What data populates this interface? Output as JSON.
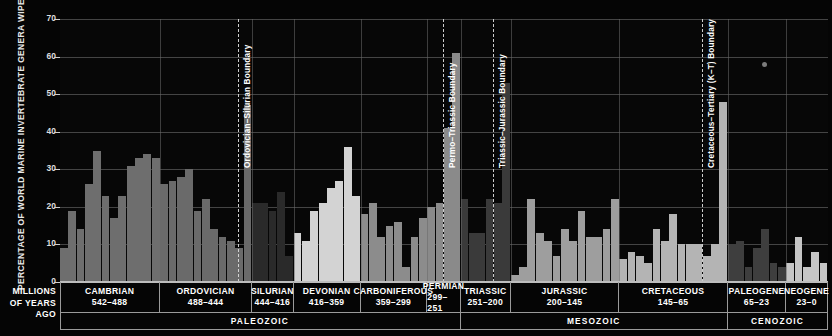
{
  "chart_data": {
    "type": "bar",
    "title": "",
    "ylabel": "PERCENTAGE OF WORLD MARINE INVERTEBRATE GENERA WIPED OUT",
    "xlabel": "MILLIONS OF YEARS AGO",
    "ylim": [
      0,
      70
    ],
    "yticks": [
      0,
      10,
      20,
      30,
      40,
      50,
      60,
      70
    ],
    "grid": true,
    "legend": "none",
    "series_name": "Extinction intensity (% marine invertebrate genera)",
    "periods": [
      {
        "name": "CAMBRIAN",
        "range": "542–488",
        "era": "PALEOZOIC",
        "color": "#6e6e6e",
        "values": [
          9,
          19,
          14,
          26,
          35,
          23,
          17,
          23,
          31,
          33,
          34,
          33
        ]
      },
      {
        "name": "ORDOVICIAN",
        "range": "488–444",
        "era": "PALEOZOIC",
        "color": "#6a6a6a",
        "values": [
          26,
          27,
          28,
          30,
          19,
          22,
          14,
          12,
          11,
          9,
          47
        ]
      },
      {
        "name": "SILURIAN",
        "range": "444–416",
        "era": "PALEOZOIC",
        "color": "#2a2a2a",
        "values": [
          21,
          21,
          19,
          24,
          7
        ]
      },
      {
        "name": "DEVONIAN",
        "range": "416–359",
        "era": "PALEOZOIC",
        "color": "#d3d3d3",
        "values": [
          13,
          11,
          19,
          21,
          25,
          27,
          36,
          23
        ]
      },
      {
        "name": "CARBONIFEROUS",
        "range": "359–299",
        "era": "PALEOZOIC",
        "color": "#8c8c8c",
        "values": [
          18,
          21,
          12,
          15,
          16,
          4,
          12,
          17
        ]
      },
      {
        "name": "PERMIAN",
        "range": "299–251",
        "era": "PALEOZOIC",
        "color": "#8a8a8a",
        "values": [
          20,
          21,
          41,
          61
        ]
      },
      {
        "name": "TRIASSIC",
        "range": "251–200",
        "era": "MESOZOIC",
        "color": "#3a3a3a",
        "values": [
          22,
          13,
          13,
          22,
          21,
          53
        ]
      },
      {
        "name": "JURASSIC",
        "range": "200–145",
        "era": "MESOZOIC",
        "color": "#9e9e9e",
        "values": [
          2,
          4,
          22,
          13,
          11,
          7,
          14,
          11,
          19,
          12,
          12,
          14,
          22
        ]
      },
      {
        "name": "CRETACEOUS",
        "range": "145–65",
        "era": "MESOZOIC",
        "color": "#b4b4b4",
        "values": [
          6,
          8,
          7,
          5,
          14,
          11,
          18,
          10,
          10,
          10,
          7,
          10,
          48
        ]
      },
      {
        "name": "PALEOGENE",
        "range": "65–23",
        "era": "CENOZOIC",
        "color": "#3e3e3e",
        "values": [
          10,
          11,
          4,
          9,
          14,
          5,
          4
        ]
      },
      {
        "name": "NEOGENE",
        "range": "23–0",
        "era": "CENOZOIC",
        "color": "#c6c6c6",
        "values": [
          5,
          12,
          4,
          8,
          5
        ]
      }
    ],
    "boundaries": [
      {
        "label": "Ordovician–Silurian Boundary",
        "at_period": "ORDOVICIAN",
        "x": 238
      },
      {
        "label": "Permo–Triassic Boundary",
        "at_period": "PERMIAN",
        "x": 443
      },
      {
        "label": "Triassic–Jurassic Boundary",
        "at_period": "TRIASSIC",
        "x": 493
      },
      {
        "label": "Cretaceous–Tertiary (K–T) Boundary",
        "at_period": "CRETACEOUS",
        "x": 702
      }
    ],
    "eras": [
      {
        "name": "PALEOZOIC"
      },
      {
        "name": "MESOZOIC"
      },
      {
        "name": "CENOZOIC"
      }
    ]
  },
  "axis": {
    "corner_label_line1": "MILLIONS",
    "corner_label_line2": "OF YEARS",
    "corner_label_line3": "AGO"
  }
}
